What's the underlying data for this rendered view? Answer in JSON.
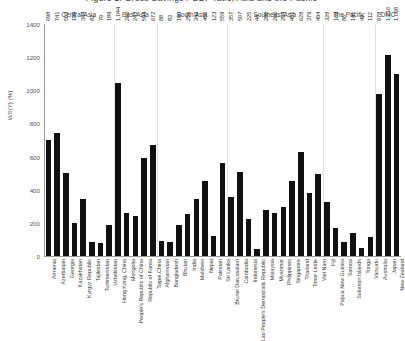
{
  "chart_data": {
    "type": "bar",
    "title": "Figure 1. Gross Savings / GDP ratio, Asia and the Pacific",
    "xlabel": "",
    "ylabel": "WS(Y) (%)",
    "ylim": [
      0,
      1400
    ],
    "yticks": [
      0,
      200,
      400,
      600,
      800,
      1000,
      1200,
      1400
    ],
    "grid": false,
    "legend": "none",
    "bar_color": "#111111",
    "categories": [
      "Armenia",
      "Azerbaijan",
      "Georgia",
      "Kazakhstan",
      "Kyrgyz Republic",
      "Tajikistan",
      "Turkmenistan",
      "Uzbekistan",
      "Hong Kong, China",
      "Mongolia",
      "People's Republic of China",
      "Republic of Korea",
      "Taipei,China",
      "Afghanistan",
      "Bangladesh",
      "Bhutan",
      "India",
      "Maldives",
      "Nepal",
      "Pakistan",
      "Sri Lanka",
      "Brunei Darussalam",
      "Cambodia",
      "Indonesia",
      "Lao People's Democratic Republic",
      "Malaysia",
      "Myanmar",
      "Philippines",
      "Singapore",
      "Thailand",
      "Timor-Leste",
      "Viet Nam",
      "Fiji",
      "Papua New Guinea",
      "Samoa",
      "Solomon Islands",
      "Tonga",
      "Vanuatu",
      "Australia",
      "Japan",
      "New Zealand"
    ],
    "values": [
      698,
      741,
      503,
      199,
      344,
      82,
      79,
      189,
      1044,
      260,
      243,
      594,
      672,
      88,
      83,
      190,
      256,
      342,
      450,
      123,
      559,
      357,
      507,
      225,
      44,
      280,
      260,
      294,
      451,
      628,
      379,
      494,
      328,
      169,
      86,
      141,
      49,
      112,
      978,
      1216,
      1098
    ],
    "value_labels": [
      "698",
      "741",
      "503",
      "199",
      "344",
      "82",
      "79",
      "189",
      "1,044",
      "260",
      "243",
      "594",
      "672",
      "88",
      "83",
      "190",
      "256",
      "342",
      "450",
      "123",
      "559",
      "357",
      "507",
      "225",
      "44",
      "280",
      "260",
      "294",
      "451",
      "628",
      "379",
      "494",
      "328",
      "169",
      "86",
      "141",
      "49",
      "112",
      "978",
      "1,216",
      "1,098"
    ],
    "groups": [
      {
        "label": "Central Asia",
        "count": 8
      },
      {
        "label": "East Asia",
        "count": 5
      },
      {
        "label": "South Asia",
        "count": 8
      },
      {
        "label": "Southeast Asia",
        "count": 11
      },
      {
        "label": "The Pacific",
        "count": 6
      },
      {
        "label": "DMC",
        "count": 3
      }
    ]
  }
}
